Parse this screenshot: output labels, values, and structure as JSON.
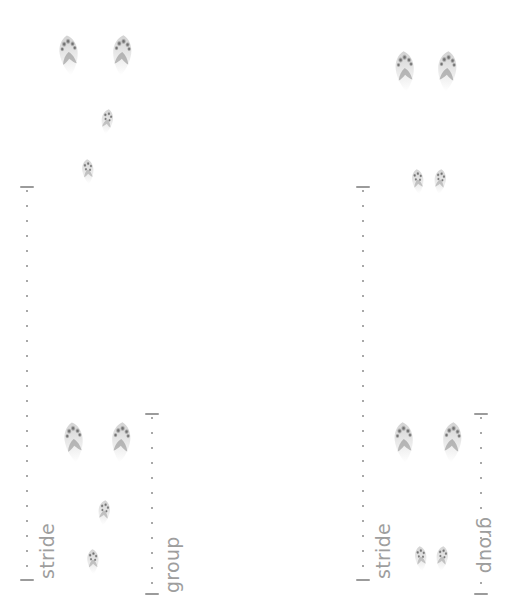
{
  "figure": {
    "background_color": "#ffffff",
    "ink_color": "#9e9e9e",
    "track_color": "#6b6b6b",
    "width": 522,
    "height": 603
  },
  "panels": [
    {
      "id": "left",
      "name": "left-track-panel",
      "brackets": [
        {
          "name": "stride-bracket",
          "label": "stride",
          "orientation": "vertical",
          "label_rotation": "-90",
          "x": 18,
          "y": 186,
          "length": 395
        },
        {
          "name": "group-bracket",
          "label": "group",
          "orientation": "vertical",
          "label_rotation": "-90",
          "x": 143,
          "y": 413,
          "length": 182
        }
      ],
      "tracks": [
        {
          "name": "track-print",
          "size": "large",
          "x": 69,
          "y": 56,
          "rotate": -6
        },
        {
          "name": "track-print",
          "size": "large",
          "x": 122,
          "y": 56,
          "rotate": 4
        },
        {
          "name": "track-print",
          "size": "small",
          "x": 107,
          "y": 122,
          "rotate": 8
        },
        {
          "name": "track-print",
          "size": "small",
          "x": 88,
          "y": 172,
          "rotate": -4
        },
        {
          "name": "track-print",
          "size": "large",
          "x": 74,
          "y": 443,
          "rotate": -6
        },
        {
          "name": "track-print",
          "size": "large",
          "x": 121,
          "y": 443,
          "rotate": 4
        },
        {
          "name": "track-print",
          "size": "small",
          "x": 104,
          "y": 513,
          "rotate": 6
        },
        {
          "name": "track-print",
          "size": "small",
          "x": 93,
          "y": 562,
          "rotate": -2
        }
      ]
    },
    {
      "id": "right",
      "name": "right-track-panel",
      "brackets": [
        {
          "name": "stride-bracket",
          "label": "stride",
          "orientation": "vertical",
          "label_rotation": "-90",
          "x": 354,
          "y": 186,
          "length": 395
        },
        {
          "name": "group-bracket",
          "label": "group",
          "orientation": "vertical",
          "label_rotation": "90",
          "x": 472,
          "y": 413,
          "length": 182
        }
      ],
      "tracks": [
        {
          "name": "track-print",
          "size": "large",
          "x": 405,
          "y": 72,
          "rotate": -4
        },
        {
          "name": "track-print",
          "size": "large",
          "x": 447,
          "y": 72,
          "rotate": 4
        },
        {
          "name": "track-print",
          "size": "small",
          "x": 418,
          "y": 182,
          "rotate": -6
        },
        {
          "name": "track-print",
          "size": "small",
          "x": 440,
          "y": 182,
          "rotate": 6
        },
        {
          "name": "track-print",
          "size": "large",
          "x": 404,
          "y": 443,
          "rotate": -4
        },
        {
          "name": "track-print",
          "size": "large",
          "x": 452,
          "y": 443,
          "rotate": 4
        },
        {
          "name": "track-print",
          "size": "small",
          "x": 421,
          "y": 559,
          "rotate": -6
        },
        {
          "name": "track-print",
          "size": "small",
          "x": 442,
          "y": 559,
          "rotate": 6
        }
      ]
    }
  ],
  "labels": {
    "stride": "stride",
    "group": "group"
  }
}
